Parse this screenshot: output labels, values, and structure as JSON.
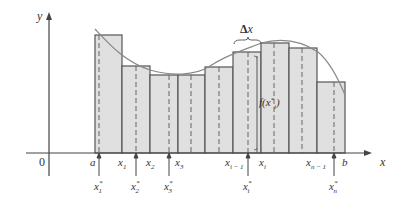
{
  "figure": {
    "type": "riemann_sum_diagram",
    "axes": {
      "x_label": "x",
      "y_label": "y",
      "origin_label": "0"
    },
    "colors": {
      "rect_fill": "#e0e0e0",
      "rect_stroke": "#555555",
      "curve": "#888888",
      "axis": "#444444"
    },
    "partition_labels": [
      {
        "id": "a",
        "text": "a",
        "sub": ""
      },
      {
        "id": "x1",
        "text": "x",
        "sub": "1"
      },
      {
        "id": "x2",
        "text": "x",
        "sub": "2"
      },
      {
        "id": "x3",
        "text": "x",
        "sub": "3"
      },
      {
        "id": "xim1",
        "text": "x",
        "sub": "i − 1"
      },
      {
        "id": "xi",
        "text": "x",
        "sub": "i"
      },
      {
        "id": "xnm1",
        "text": "x",
        "sub": "n − 1"
      },
      {
        "id": "b",
        "text": "b",
        "sub": ""
      }
    ],
    "sample_labels": [
      {
        "id": "x1s",
        "text": "x",
        "sup": "*",
        "sub": "1"
      },
      {
        "id": "x2s",
        "text": "x",
        "sup": "*",
        "sub": "2"
      },
      {
        "id": "x3s",
        "text": "x",
        "sup": "*",
        "sub": "3"
      },
      {
        "id": "xis",
        "text": "x",
        "sup": "*",
        "sub": "i"
      },
      {
        "id": "xns",
        "text": "x",
        "sup": "*",
        "sub": "n"
      }
    ],
    "annotations": {
      "delta_x": "Δx",
      "height_label": "f(x*ᵢ)"
    }
  }
}
